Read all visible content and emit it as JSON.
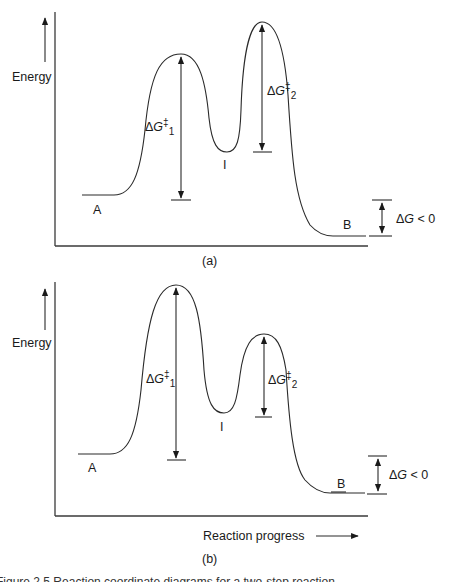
{
  "panels": [
    {
      "id": "a",
      "label": "(a)",
      "y_axis_label": "Energy",
      "x_axis_label": "",
      "states": {
        "reactant": "A",
        "intermediate": "I",
        "product": "B"
      },
      "annotations": {
        "barrier1": {
          "delta": "Δ",
          "G": "G",
          "dagger": "‡",
          "sub": "1"
        },
        "barrier2": {
          "delta": "Δ",
          "G": "G",
          "dagger": "‡",
          "sub": "2"
        },
        "overall": {
          "delta": "Δ",
          "G": "G",
          "rest": " < 0"
        }
      },
      "profile": {
        "reactant_level": "low",
        "ts1": "high",
        "intermediate": "medium",
        "ts2": "highest",
        "product_level": "lowest"
      }
    },
    {
      "id": "b",
      "label": "(b)",
      "y_axis_label": "Energy",
      "x_axis_label": "Reaction progress",
      "states": {
        "reactant": "A",
        "intermediate": "I",
        "product": "B"
      },
      "annotations": {
        "barrier1": {
          "delta": "Δ",
          "G": "G",
          "dagger": "‡",
          "sub": "1"
        },
        "barrier2": {
          "delta": "Δ",
          "G": "G",
          "dagger": "‡",
          "sub": "2"
        },
        "overall": {
          "delta": "Δ",
          "G": "G",
          "rest": " < 0"
        }
      },
      "profile": {
        "reactant_level": "low",
        "ts1": "highest",
        "intermediate": "medium",
        "ts2": "high",
        "product_level": "lowest"
      }
    }
  ],
  "caption": "Figure 2.5  Reaction coordinate diagrams for a two-step reaction..."
}
